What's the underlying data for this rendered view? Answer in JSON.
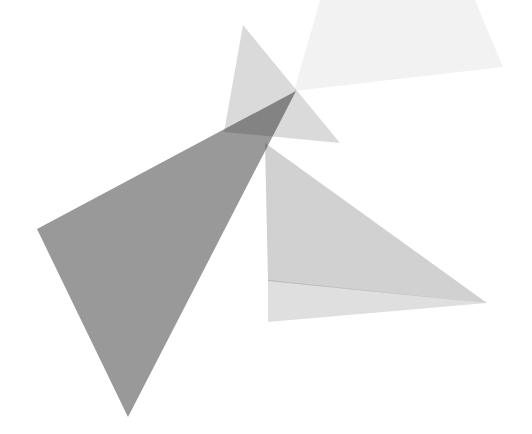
{
  "canvas": {
    "width": 532,
    "height": 434,
    "background": "#ffffff"
  },
  "figure": {
    "type": "abstract-overlapping-triangles"
  },
  "triangles": [
    {
      "name": "pale-top-right-triangle",
      "points": "294,91 383,-220 503,67",
      "color": "#000000",
      "opacity": 0.05,
      "solo_shade": "#f2f2f2"
    },
    {
      "name": "narrow-apex-triangle",
      "points": "243,25 224,132 340,143",
      "color": "#000000",
      "opacity": 0.145,
      "solo_shade": "#d3d3d3"
    },
    {
      "name": "central-light-triangle",
      "points": "265,143 268,281 487,303",
      "color": "#000000",
      "opacity": 0.18,
      "solo_shade": "#d1d1d1"
    },
    {
      "name": "shallow-bottom-right-triangle",
      "points": "268,280 268,322 487,303",
      "color": "#000000",
      "opacity": 0.125,
      "solo_shade": "#d8d8d8"
    },
    {
      "name": "large-left-dark-triangle",
      "points": "37,229 296,91 128,417",
      "color": "#000000",
      "opacity": 0.4,
      "solo_shade": "#999999"
    }
  ],
  "overlap_shades": {
    "dark-wedge-left-of-convergence": "#848484"
  }
}
